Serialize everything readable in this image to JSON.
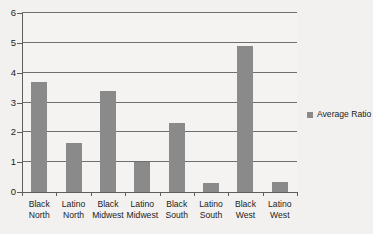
{
  "chart_data": {
    "type": "bar",
    "title": "",
    "subtitle": "",
    "xlabel": "",
    "ylabel": "",
    "categories": [
      "Black North",
      "Latino North",
      "Black Midwest",
      "Latino Midwest",
      "Black South",
      "Latino South",
      "Black West",
      "Latino West"
    ],
    "category_lines": [
      {
        "line1": "Black",
        "line2": "North"
      },
      {
        "line1": "Latino",
        "line2": "North"
      },
      {
        "line1": "Black",
        "line2": "Midwest"
      },
      {
        "line1": "Latino",
        "line2": "Midwest"
      },
      {
        "line1": "Black",
        "line2": "South"
      },
      {
        "line1": "Latino",
        "line2": "South"
      },
      {
        "line1": "Black",
        "line2": "West"
      },
      {
        "line1": "Latino",
        "line2": "West"
      }
    ],
    "series": [
      {
        "name": "Average Ratio",
        "color": "#8a8a8a",
        "values": [
          3.68,
          1.65,
          3.4,
          1.0,
          2.3,
          0.3,
          4.88,
          0.35
        ]
      }
    ],
    "ylim": [
      0,
      6
    ],
    "yticks": [
      0,
      1,
      2,
      3,
      4,
      5,
      6
    ],
    "ytick_labels": [
      "0",
      "1",
      "2",
      "3",
      "4",
      "5",
      "6"
    ],
    "grid": true,
    "grid_axis": "y",
    "legend": {
      "position": "right",
      "entries": [
        {
          "label": "Average Ratio",
          "color": "#8a8a8a",
          "marker": "square"
        }
      ]
    },
    "colors": {
      "bar": "#8a8a8a",
      "background": "#f2f1ef",
      "plot_background": "#f4f3f1",
      "axis": "#5d5d5d",
      "gridline": "#6f6f6f",
      "text": "#1c1c1c"
    }
  }
}
